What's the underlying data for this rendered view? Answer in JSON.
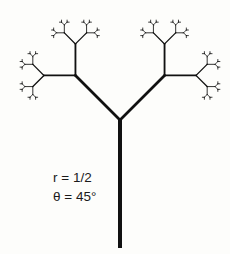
{
  "diagram": {
    "type": "fractal-binary-tree",
    "labels": {
      "ratio": "r = 1/2",
      "angle": "θ = 45°"
    },
    "parameters": {
      "ratio": 0.5,
      "angle_deg": 45,
      "depth": 6
    },
    "trunk": {
      "base_x": 120,
      "base_y": 246,
      "length": 126,
      "stroke_width": 4
    },
    "colors": {
      "stroke": "#111111",
      "background": "#fdfdfb",
      "text": "#1a1a1a"
    }
  }
}
